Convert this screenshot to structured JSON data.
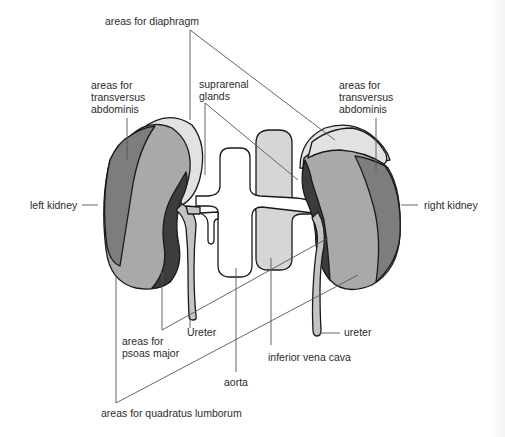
{
  "diagram": {
    "labels": {
      "diaphragm": "areas for diaphragm",
      "suprarenal_1": "suprarenal",
      "suprarenal_2": "glands",
      "left_transversus_1": "areas for",
      "left_transversus_2": "transversus",
      "left_transversus_3": "abdominis",
      "right_transversus_1": "areas for",
      "right_transversus_2": "transversus",
      "right_transversus_3": "abdominis",
      "left_kidney": "left kidney",
      "right_kidney": "right kidney",
      "ureter_left": "Ureter",
      "ureter_right": "ureter",
      "psoas_1": "areas for",
      "psoas_2": "psoas major",
      "ivc": "inferior vena cava",
      "aorta": "aorta",
      "quadratus": "areas for quadratus lumborum"
    },
    "colors": {
      "diaphragm_area": "#e2e2e2",
      "transversus_area": "#7d7d7d",
      "quadratus_area": "#a9a9a9",
      "psoas_area": "#3c3c3c",
      "ivc": "#d6d6d6",
      "aorta": "#ffffff",
      "ureter": "#c4c4c4",
      "outline": "#1a1a1a"
    }
  }
}
